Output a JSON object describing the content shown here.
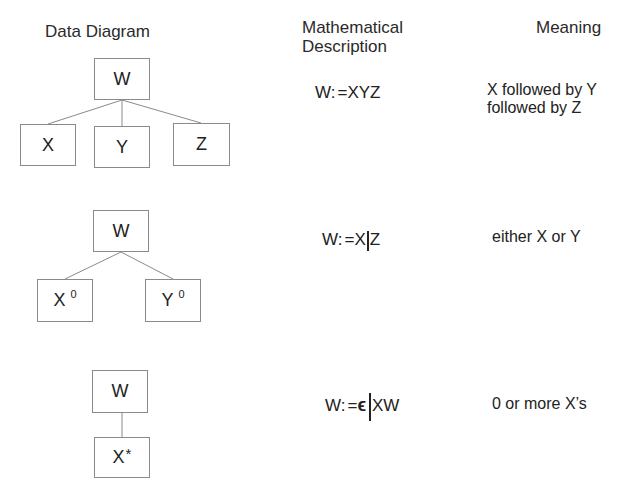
{
  "headers": {
    "data_diagram": "Data Diagram",
    "math_description_line1": "Mathematical",
    "math_description_line2": "Description",
    "meaning": "Meaning"
  },
  "rows": [
    {
      "type": "sequence",
      "diagram": {
        "parent": "W",
        "children": [
          {
            "label": "X",
            "marker": ""
          },
          {
            "label": "Y",
            "marker": ""
          },
          {
            "label": "Z",
            "marker": ""
          }
        ]
      },
      "formula": {
        "lhs": "W:",
        "op": "=",
        "rhs": "XYZ"
      },
      "meaning": {
        "line1": "X followed by Y",
        "line2": "followed by Z"
      }
    },
    {
      "type": "selection",
      "diagram": {
        "parent": "W",
        "children": [
          {
            "label": "X",
            "marker": "0"
          },
          {
            "label": "Y",
            "marker": "0"
          }
        ]
      },
      "formula": {
        "lhs": "W:",
        "op": "=",
        "left": "X",
        "separator": "|",
        "right": "Z"
      },
      "meaning": {
        "line1": "either X or Y"
      }
    },
    {
      "type": "iteration",
      "diagram": {
        "parent": "W",
        "children": [
          {
            "label": "X",
            "marker": "*"
          }
        ]
      },
      "formula": {
        "lhs": "W:",
        "op": "=",
        "left": "ϵ",
        "separator": "|",
        "right": "XW"
      },
      "meaning": {
        "line1": "0 or more X’s"
      }
    }
  ],
  "colors": {
    "text": "#222222",
    "box_border": "#8a8a8a",
    "background": "#ffffff"
  }
}
